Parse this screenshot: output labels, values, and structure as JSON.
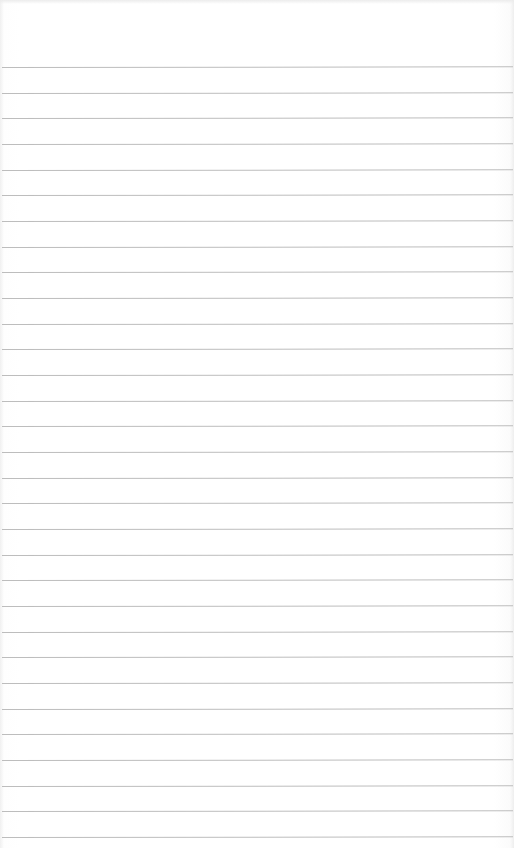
{
  "page": {
    "type": "blank lined notebook paper",
    "background_color": "#ffffff",
    "line_color": "#bdbdbd",
    "line_count": 31,
    "first_line_y": 67,
    "line_spacing_px": 25.67,
    "text_content": ""
  }
}
